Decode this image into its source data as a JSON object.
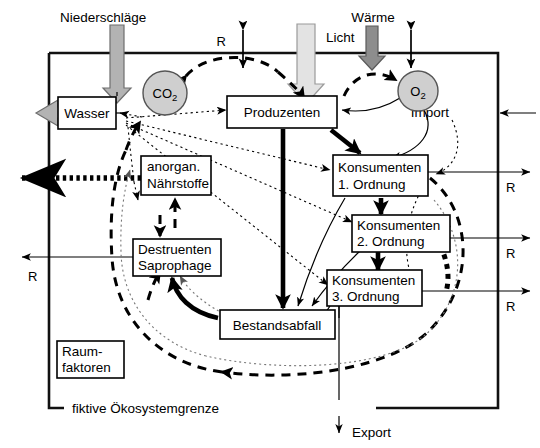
{
  "figure": {
    "boundary_label": "fiktive Ökosystemgrenze"
  },
  "nodes": {
    "wasser": "Wasser",
    "produzenten": "Produzenten",
    "naehrstoffe_line1": "anorgan.",
    "naehrstoffe_line2": "Nährstoffe",
    "destruenten_line1": "Destruenten",
    "destruenten_line2": "Saprophage",
    "bestandsabfall": "Bestandsabfall",
    "raumfaktoren_line1": "Raum-",
    "raumfaktoren_line2": "faktoren",
    "konsumenten1_line1": "Konsumenten",
    "konsumenten1_line2": "1. Ordnung",
    "konsumenten2_line1": "Konsumenten",
    "konsumenten2_line2": "2. Ordnung",
    "konsumenten3_line1": "Konsumenten",
    "konsumenten3_line2": "3. Ordnung"
  },
  "gases": {
    "co2_main": "CO",
    "co2_sub": "2",
    "o2_main": "O",
    "o2_sub": "2"
  },
  "flows": {
    "niederschlaege": "Niederschläge",
    "licht": "Licht",
    "waerme": "Wärme",
    "import": "Import",
    "export": "Export",
    "r_top": "R",
    "r_right_1": "R",
    "r_right_2": "R",
    "r_right_3": "R",
    "r_left": "R"
  },
  "colors": {
    "background": "#ffffff",
    "stroke": "#000000",
    "frame": "#111111",
    "gas_fill": "#cfcfcf",
    "precip_arrow": "#b3b3b3",
    "light_arrow": "#e3e3e3",
    "heat_arrow": "#8d8d8d"
  }
}
